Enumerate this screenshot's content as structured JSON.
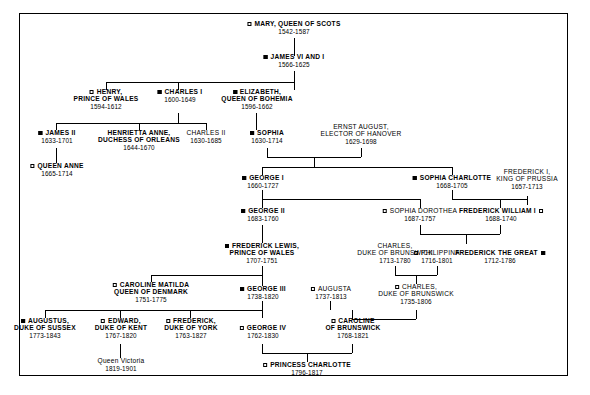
{
  "chart": {
    "type": "genealogy-tree",
    "title": "",
    "marker_legend": {
      "filled_square": "filled",
      "hollow_square": "hollow"
    }
  },
  "people": {
    "mary": {
      "name_lines": [
        "MARY, QUEEN OF SCOTS"
      ],
      "dates": "1542-1587",
      "marker": "hollow",
      "marker_side": "left",
      "bold": true
    },
    "james_vi": {
      "name_lines": [
        "JAMES VI AND I"
      ],
      "dates": "1566-1625",
      "marker": "filled",
      "marker_side": "left",
      "bold": true
    },
    "henry": {
      "name_lines": [
        "HENRY,",
        "PRINCE OF WALES"
      ],
      "dates": "1594-1612",
      "marker": "hollow",
      "marker_side": "left",
      "bold": true
    },
    "charles_i": {
      "name_lines": [
        "CHARLES I"
      ],
      "dates": "1600-1649",
      "marker": "filled",
      "marker_side": "left",
      "bold": true
    },
    "elizabeth": {
      "name_lines": [
        "ELIZABETH,",
        "QUEEN OF BOHEMIA"
      ],
      "dates": "1596-1662",
      "marker": "filled",
      "marker_side": "left",
      "bold": true
    },
    "james_ii": {
      "name_lines": [
        "JAMES II"
      ],
      "dates": "1633-1701",
      "marker": "filled",
      "marker_side": "left",
      "bold": true
    },
    "henrietta": {
      "name_lines": [
        "HENRIETTA ANNE,",
        "DUCHESS OF ORLEANS"
      ],
      "dates": "1644-1670",
      "marker": "none",
      "marker_side": "left",
      "bold": true
    },
    "charles_ii": {
      "name_lines": [
        "CHARLES II"
      ],
      "dates": "1630-1685",
      "marker": "none",
      "marker_side": "left",
      "bold": false
    },
    "sophia": {
      "name_lines": [
        "SOPHIA"
      ],
      "dates": "1630-1714",
      "marker": "filled",
      "marker_side": "left",
      "bold": true
    },
    "ernst_august": {
      "name_lines": [
        "ERNST AUGUST,",
        "ELECTOR OF HANOVER"
      ],
      "dates": "1629-1698",
      "marker": "none",
      "marker_side": "left",
      "bold": false
    },
    "queen_anne": {
      "name_lines": [
        "QUEEN ANNE"
      ],
      "dates": "1665-1714",
      "marker": "hollow",
      "marker_side": "left",
      "bold": true
    },
    "george_i": {
      "name_lines": [
        "GEORGE I"
      ],
      "dates": "1660-1727",
      "marker": "filled",
      "marker_side": "left",
      "bold": true
    },
    "sophia_charlotte": {
      "name_lines": [
        "SOPHIA CHARLOTTE"
      ],
      "dates": "1668-1705",
      "marker": "filled",
      "marker_side": "left",
      "bold": true
    },
    "frederick_i_prussia": {
      "name_lines": [
        "FREDERICK I,",
        "KING OF PRUSSIA"
      ],
      "dates": "1657-1713",
      "marker": "none",
      "marker_side": "left",
      "bold": false
    },
    "george_ii": {
      "name_lines": [
        "GEORGE II"
      ],
      "dates": "1683-1760",
      "marker": "filled",
      "marker_side": "left",
      "bold": true
    },
    "sophia_dorothea": {
      "name_lines": [
        "SOPHIA DOROTHEA"
      ],
      "dates": "1687-1757",
      "marker": "hollow",
      "marker_side": "left",
      "bold": false
    },
    "frederick_william_i": {
      "name_lines": [
        "FREDERICK WILLIAM I"
      ],
      "dates": "1688-1740",
      "marker": "hollow",
      "marker_side": "right",
      "bold": true
    },
    "frederick_lewis": {
      "name_lines": [
        "FREDERICK LEWIS,",
        "PRINCE OF WALES"
      ],
      "dates": "1707-1751",
      "marker": "filled",
      "marker_side": "left",
      "bold": true
    },
    "charles_brunswick_sr": {
      "name_lines": [
        "CHARLES,",
        "DUKE OF BRUNSWICK"
      ],
      "dates": "1713-1780",
      "marker": "none",
      "marker_side": "left",
      "bold": false
    },
    "philippina": {
      "name_lines": [
        "PHILIPPINA"
      ],
      "dates": "1716-1801",
      "marker": "hollow",
      "marker_side": "left",
      "bold": false
    },
    "frederick_the_great": {
      "name_lines": [
        "FREDERICK THE GREAT"
      ],
      "dates": "1712-1786",
      "marker": "filled",
      "marker_side": "right",
      "bold": true
    },
    "caroline_matilda": {
      "name_lines": [
        "CAROLINE MATILDA",
        "QUEEN OF DENMARK"
      ],
      "dates": "1751-1775",
      "marker": "hollow",
      "marker_side": "left",
      "bold": true
    },
    "george_iii": {
      "name_lines": [
        "GEORGE III"
      ],
      "dates": "1738-1820",
      "marker": "filled",
      "marker_side": "left",
      "bold": true
    },
    "augusta": {
      "name_lines": [
        "AUGUSTA"
      ],
      "dates": "1737-1813",
      "marker": "hollow",
      "marker_side": "left",
      "bold": false
    },
    "charles_brunswick_jr": {
      "name_lines": [
        "CHARLES,",
        "DUKE OF BRUNSWICK"
      ],
      "dates": "1735-1806",
      "marker": "hollow",
      "marker_side": "left",
      "bold": false
    },
    "augustus": {
      "name_lines": [
        "AUGUSTUS,",
        "DUKE OF SUSSEX"
      ],
      "dates": "1773-1843",
      "marker": "filled",
      "marker_side": "left",
      "bold": true
    },
    "edward": {
      "name_lines": [
        "EDWARD,",
        "DUKE OF KENT"
      ],
      "dates": "1767-1820",
      "marker": "hollow",
      "marker_side": "left",
      "bold": true
    },
    "frederick_york": {
      "name_lines": [
        "FREDERICK,",
        "DUKE OF YORK"
      ],
      "dates": "1763-1827",
      "marker": "hollow",
      "marker_side": "left",
      "bold": true
    },
    "george_iv": {
      "name_lines": [
        "GEORGE IV"
      ],
      "dates": "1762-1830",
      "marker": "hollow",
      "marker_side": "left",
      "bold": true
    },
    "caroline_brunswick": {
      "name_lines": [
        "CAROLINE",
        "OF BRUNSWICK"
      ],
      "dates": "1768-1821",
      "marker": "hollow",
      "marker_side": "left",
      "bold": true
    },
    "queen_victoria": {
      "name_lines": [
        "Queen Victoria"
      ],
      "dates": "1819-1901",
      "marker": "none",
      "marker_side": "left",
      "bold": false
    },
    "princess_charlotte": {
      "name_lines": [
        "PRINCESS CHARLOTTE"
      ],
      "dates": "1796-1817",
      "marker": "hollow",
      "marker_side": "left",
      "bold": true
    }
  }
}
